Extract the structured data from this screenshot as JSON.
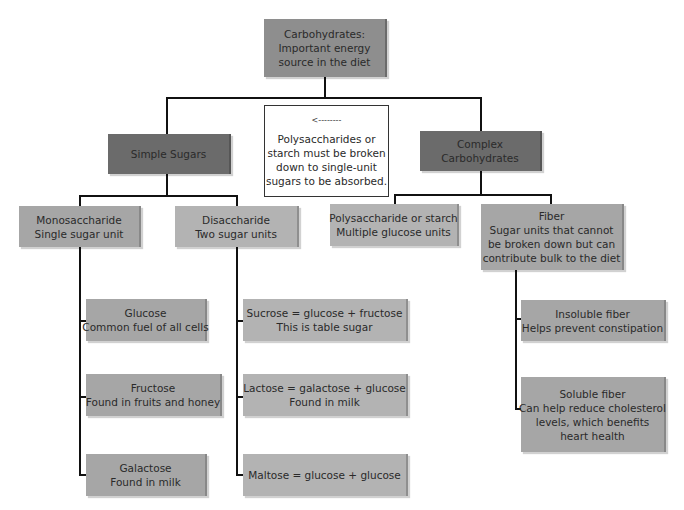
{
  "root": {
    "lines": [
      "Carbohydrates:",
      "Important energy",
      "source in the diet"
    ]
  },
  "note": {
    "arrow": "<--------",
    "lines": [
      "Polysaccharides or",
      "starch must be broken",
      "down to single-unit",
      "sugars to be absorbed."
    ]
  },
  "simple": {
    "lines": [
      "Simple Sugars"
    ]
  },
  "complex": {
    "lines": [
      "Complex",
      "Carbohydrates"
    ]
  },
  "mono": {
    "lines": [
      "Monosaccharide",
      "Single sugar unit"
    ]
  },
  "di": {
    "lines": [
      "Disaccharide",
      "Two sugar units"
    ]
  },
  "poly": {
    "lines": [
      "Polysaccharide or starch",
      "Multiple glucose units"
    ]
  },
  "fiber": {
    "lines": [
      "Fiber",
      "Sugar units that cannot",
      "be broken down but can",
      "contribute bulk to the diet"
    ]
  },
  "glucose": {
    "lines": [
      "Glucose",
      "Common fuel of all cells"
    ]
  },
  "fructose": {
    "lines": [
      "Fructose",
      "Found in fruits and honey"
    ]
  },
  "galactose": {
    "lines": [
      "Galactose",
      "Found in milk"
    ]
  },
  "sucrose": {
    "lines": [
      "Sucrose = glucose + fructose",
      "This is table sugar"
    ]
  },
  "lactose": {
    "lines": [
      "Lactose = galactose + glucose",
      "Found in milk"
    ]
  },
  "maltose": {
    "lines": [
      "Maltose = glucose + glucose"
    ]
  },
  "insoluble": {
    "lines": [
      "Insoluble fiber",
      "Helps prevent constipation"
    ]
  },
  "soluble": {
    "lines": [
      "Soluble fiber",
      "Can help reduce cholesterol",
      "levels, which benefits",
      "heart health"
    ]
  },
  "colors": {
    "root": "#8e8e8e",
    "dark": "#6b6b6b",
    "mid": "#a6a6a6",
    "light": "#b3b3b3",
    "line": "#111111"
  }
}
